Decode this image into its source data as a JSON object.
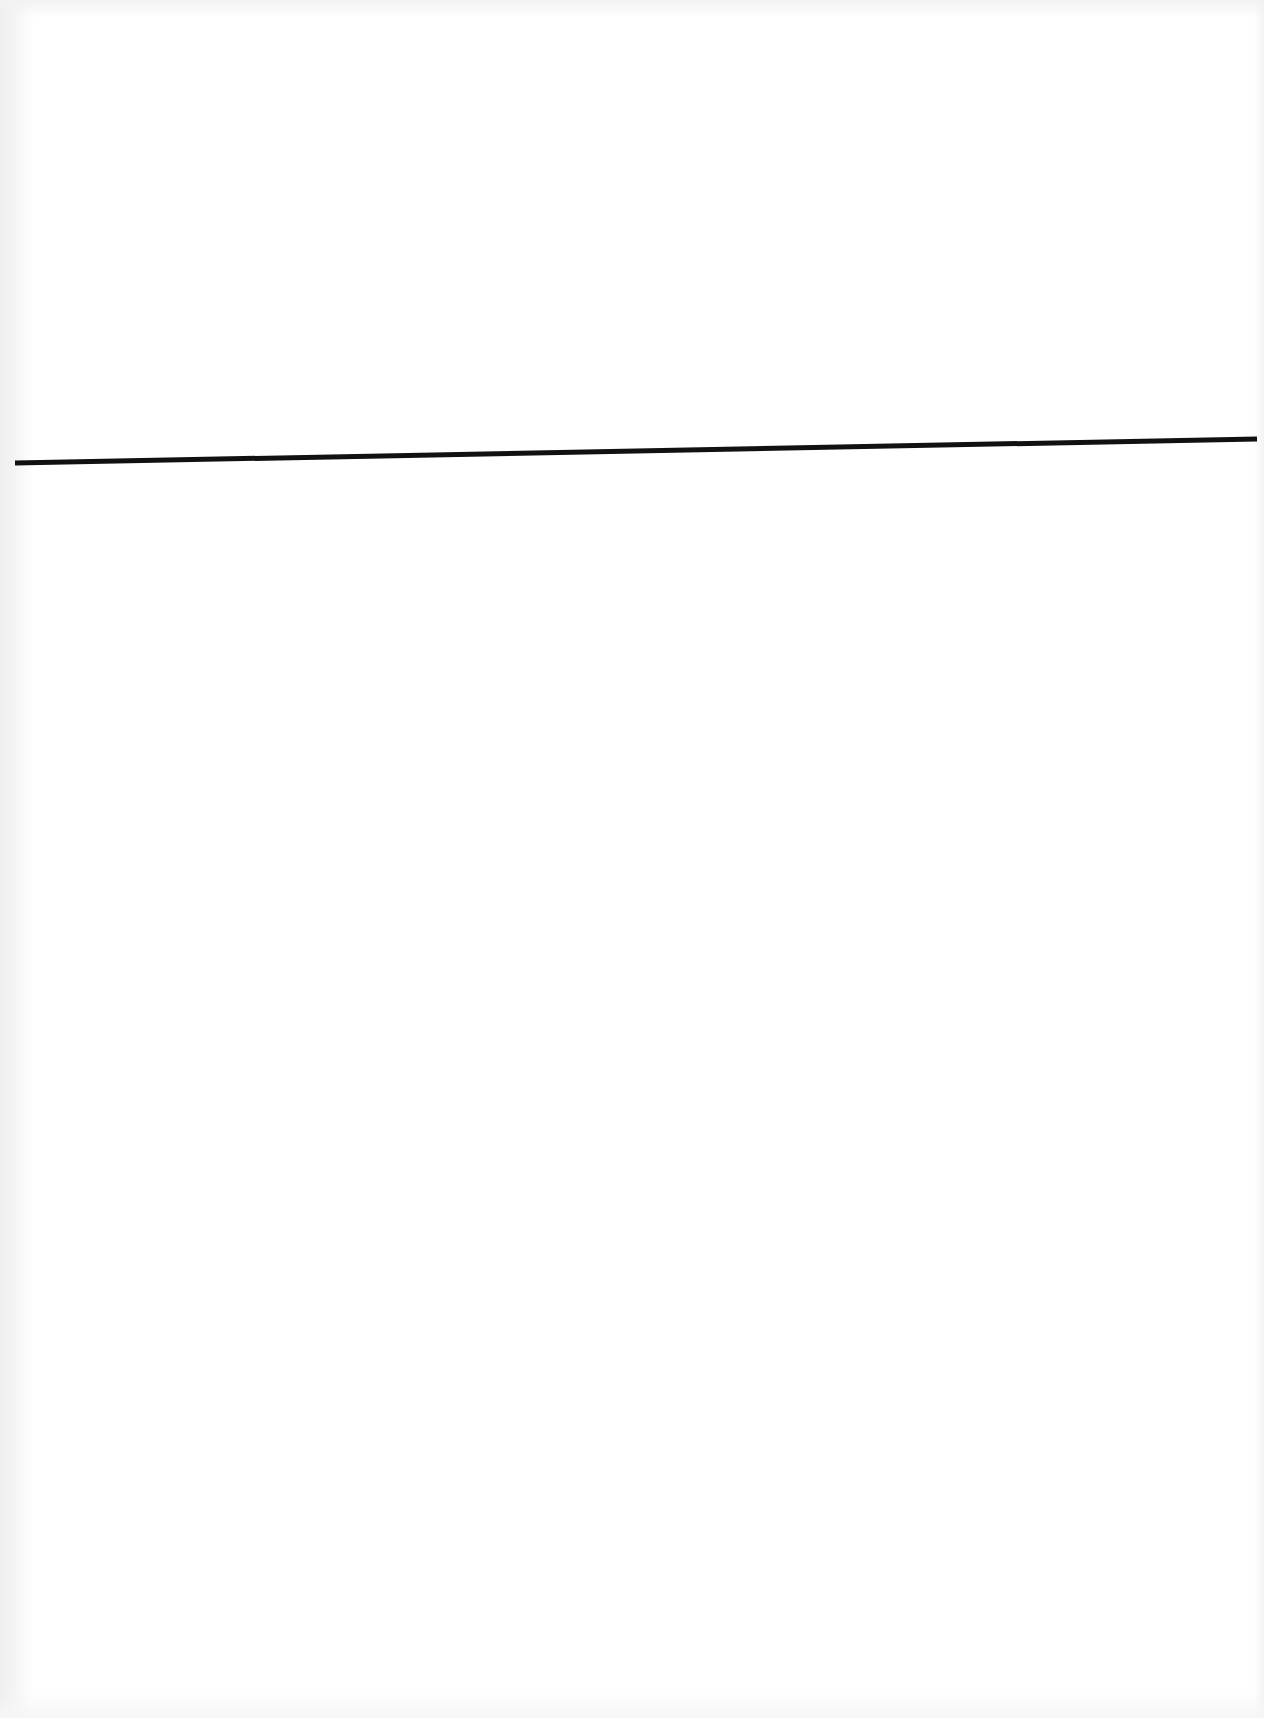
{
  "document": {
    "type": "blank scanned page",
    "background_color": "#ffffff",
    "rule": {
      "color": "#111111",
      "thickness_px": 5,
      "start": {
        "x": 15,
        "y": 463
      },
      "end": {
        "x": 1257,
        "y": 439
      }
    }
  }
}
